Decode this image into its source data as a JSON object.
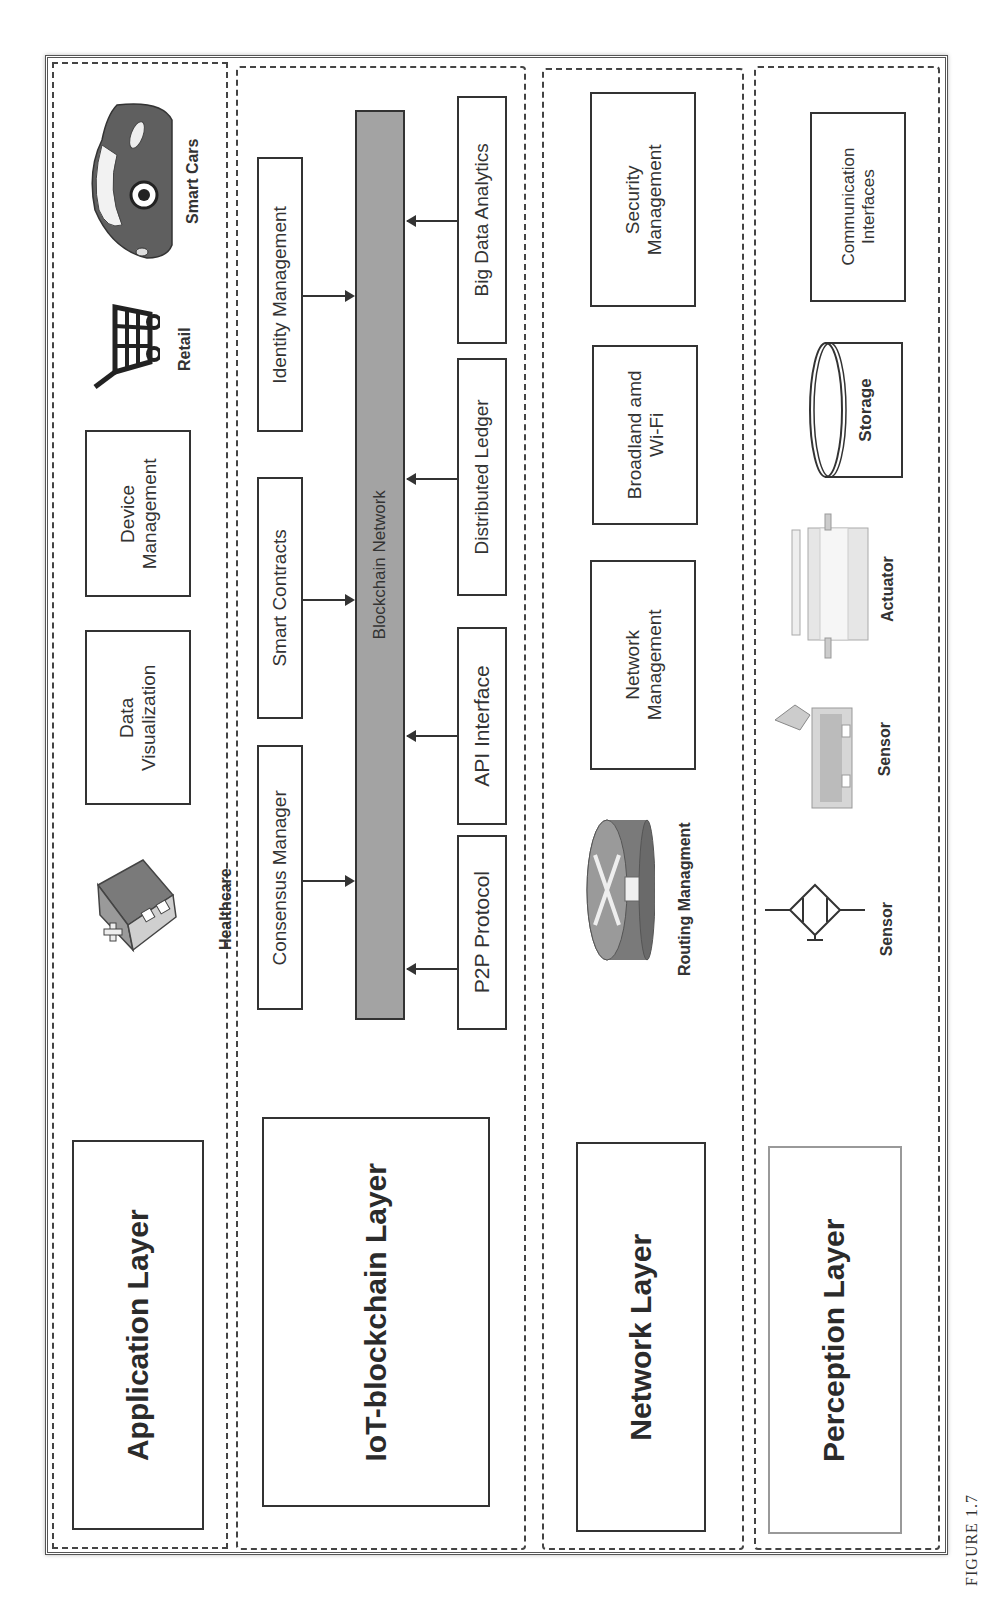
{
  "figure": {
    "caption": "FIGURE 1.7",
    "orientation": "rotated 90 degrees counter-clockwise"
  },
  "layers": {
    "application": {
      "title": "Application Layer",
      "boxes": [
        "Data Visualization",
        "Device Management"
      ],
      "box_lines": [
        [
          "Data",
          "Visualization"
        ],
        [
          "Device",
          "Management"
        ]
      ],
      "icons": [
        {
          "label": "Healthcare",
          "icon": "hospital-icon"
        },
        {
          "label": "Retail",
          "icon": "shopping-cart-icon"
        },
        {
          "label": "Smart Cars",
          "icon": "car-icon"
        }
      ]
    },
    "iot_blockchain": {
      "title": "IoT-blockchain Layer",
      "core": "Blockchain Network",
      "inputs_top": [
        "Consensus Manager",
        "Smart Contracts",
        "Identity Management"
      ],
      "inputs_bottom": [
        "P2P Protocol",
        "API Interface",
        "Distributed Ledger",
        "Big Data Analytics"
      ]
    },
    "network": {
      "title": "Network Layer",
      "boxes": [
        "Network Management",
        "Broadland amd Wi-Fi",
        "Security Management"
      ],
      "box_lines": [
        [
          "Network",
          "Management"
        ],
        [
          "Broadland amd",
          "Wi-Fi"
        ],
        [
          "Security",
          "Management"
        ]
      ],
      "icons": [
        {
          "label": "Routing Managment",
          "icon": "router-icon"
        }
      ]
    },
    "perception": {
      "title": "Perception Layer",
      "icons": [
        {
          "label": "Sensor",
          "icon": "sensor-symbol-icon"
        },
        {
          "label": "Sensor",
          "icon": "sensor-device-icon"
        },
        {
          "label": "Actuator",
          "icon": "actuator-icon"
        },
        {
          "label": "Storage",
          "icon": "storage-cylinder-icon"
        }
      ],
      "boxes": [
        "Communication Interfaces"
      ],
      "box_lines": [
        [
          "Communication",
          "Interfaces"
        ]
      ]
    }
  },
  "colors": {
    "border": "#333333",
    "bar_fill": "#a3a3a3",
    "background": "#ffffff"
  }
}
